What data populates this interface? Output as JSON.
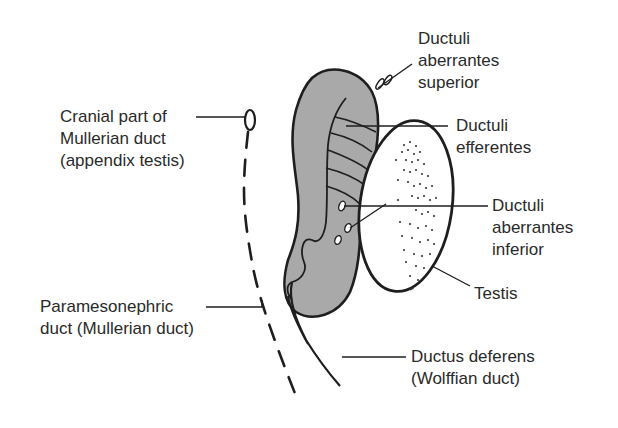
{
  "diagram": {
    "type": "anatomical-illustration",
    "colors": {
      "background": "#ffffff",
      "outline": "#1e1e1e",
      "epididymis_fill": "#a9a9a9",
      "testis_fill": "#ffffff",
      "text": "#2a2a2a"
    },
    "labels": {
      "cranial_mullerian": [
        "Cranial part of",
        "Mullerian duct",
        "(appendix testis)"
      ],
      "ductuli_aberrantes_superior": [
        "Ductuli",
        "aberrantes",
        "superior"
      ],
      "ductuli_efferentes": [
        "Ductuli",
        "efferentes"
      ],
      "ductuli_aberrantes_inferior": [
        "Ductuli",
        "aberrantes",
        "inferior"
      ],
      "testis": [
        "Testis"
      ],
      "paramesonephric_duct": [
        "Paramesonephric",
        "duct (Mullerian duct)"
      ],
      "ductus_deferens": [
        "Ductus deferens",
        "(Wolffian duct)"
      ]
    }
  }
}
